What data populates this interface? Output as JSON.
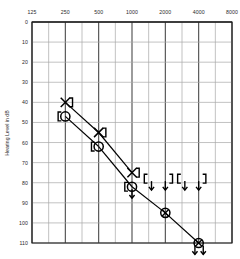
{
  "chart_data": {
    "type": "scatter",
    "title": "",
    "xlabel": "",
    "ylabel": "Hearing Level in dB",
    "x_scale": "log2-octave",
    "categories": [
      125,
      250,
      500,
      1000,
      2000,
      4000,
      8000
    ],
    "xtick_labels": [
      "125",
      "250",
      "500",
      "1000",
      "2000",
      "4000",
      "8000"
    ],
    "ytick_labels": [
      "0",
      "10",
      "20",
      "30",
      "40",
      "50",
      "60",
      "70",
      "80",
      "90",
      "100",
      "110"
    ],
    "ylim": [
      0,
      110
    ],
    "ytick_step": 10,
    "grid": true,
    "y_axis_inverted": true,
    "legend": "none",
    "series": [
      {
        "name": "Left air conduction (X)",
        "symbol": "x",
        "connected": true,
        "points": [
          {
            "freq": 250,
            "db": 40
          },
          {
            "freq": 500,
            "db": 55
          },
          {
            "freq": 1000,
            "db": 75
          }
        ]
      },
      {
        "name": "Right air conduction (O)",
        "symbol": "circle",
        "connected": true,
        "points": [
          {
            "freq": 250,
            "db": 47
          },
          {
            "freq": 500,
            "db": 62
          },
          {
            "freq": 1000,
            "db": 82
          }
        ]
      },
      {
        "name": "No response air conduction (crossed circle)",
        "symbol": "crossed-circle",
        "connected": true,
        "points": [
          {
            "freq": 2000,
            "db": 95
          },
          {
            "freq": 4000,
            "db": 110,
            "no_response": true
          }
        ]
      },
      {
        "name": "Masked bone conduction right (left bracket)",
        "symbol": "bracket-left",
        "connected": false,
        "points": [
          {
            "freq": 250,
            "db": 47
          },
          {
            "freq": 500,
            "db": 62
          },
          {
            "freq": 1000,
            "db": 82,
            "no_response": true
          },
          {
            "freq": 1500,
            "db": 78,
            "no_response": true
          },
          {
            "freq": 3000,
            "db": 78,
            "no_response": true
          }
        ]
      },
      {
        "name": "Masked bone conduction left (right bracket)",
        "symbol": "bracket-right",
        "connected": false,
        "points": [
          {
            "freq": 250,
            "db": 40
          },
          {
            "freq": 500,
            "db": 55
          },
          {
            "freq": 1000,
            "db": 75
          },
          {
            "freq": 2000,
            "db": 78,
            "no_response": true
          },
          {
            "freq": 4000,
            "db": 78,
            "no_response": true
          }
        ]
      }
    ],
    "annotations": [
      {
        "kind": "down-arrow",
        "freq": 1000,
        "db": 82
      },
      {
        "kind": "down-arrow",
        "freq": 1500,
        "db": 78
      },
      {
        "kind": "down-arrow",
        "freq": 2000,
        "db": 78
      },
      {
        "kind": "down-arrow",
        "freq": 3000,
        "db": 78
      },
      {
        "kind": "down-arrow",
        "freq": 4000,
        "db": 78
      },
      {
        "kind": "down-arrow",
        "freq": 3700,
        "db": 110
      },
      {
        "kind": "down-arrow",
        "freq": 4400,
        "db": 110
      }
    ],
    "colors": {
      "grid_major": "#4a4a4a",
      "grid_minor": "#a8a8a8",
      "axis": "#1a1a1a",
      "marker": "#000000",
      "zero_line": "#3a3a3a"
    }
  }
}
